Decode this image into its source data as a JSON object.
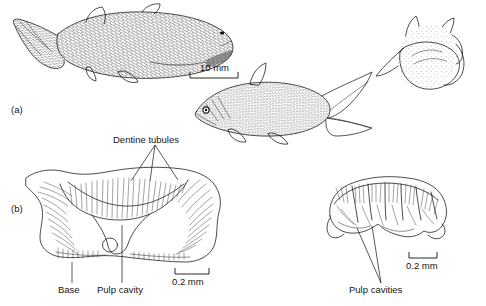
{
  "figure": {
    "kind": "scientific-illustration",
    "background_color": "#ffffff",
    "ink_color": "#111111",
    "panels": [
      {
        "id": "a",
        "label": "(a)",
        "caption_text": "(a)",
        "subjects": [
          {
            "name": "whole-fish-lateral",
            "description": "complete scaled fossil fish in lateral view, tail to left"
          },
          {
            "name": "fish-head-and-tail",
            "description": "second fossil fish, head with large eye facing left, forked caudal fin"
          },
          {
            "name": "fossil-specimen-3d",
            "description": "stippled three-dimensional fossil specimen block"
          }
        ],
        "scale_bars": [
          {
            "name": "scale-bar-10mm",
            "label": "10 mm"
          }
        ]
      },
      {
        "id": "b",
        "label": "(b)",
        "caption_text": "(b)",
        "subjects": [
          {
            "name": "denticle-section-left",
            "description": "dermal denticle cross-section with radiating dentine tubules"
          },
          {
            "name": "denticle-section-right",
            "description": "second denticle cross-section with multiple pulp cavities"
          }
        ],
        "scale_bars": [
          {
            "name": "scale-bar-0.2mm-left",
            "label": "0.2 mm"
          },
          {
            "name": "scale-bar-0.2mm-right",
            "label": "0.2 mm"
          }
        ]
      }
    ],
    "annotations": [
      {
        "name": "dentine-tubules-label",
        "text": "Dentine tubules",
        "leader_count": 3
      },
      {
        "name": "base-label",
        "text": "Base",
        "leader_count": 1
      },
      {
        "name": "pulp-cavity-label",
        "text": "Pulp cavity",
        "leader_count": 1
      },
      {
        "name": "pulp-cavities-label",
        "text": "Pulp cavities",
        "leader_count": 2
      }
    ],
    "labels": {
      "panel_a": "(a)",
      "panel_b": "(b)",
      "scale_10mm": "10 mm",
      "scale_02mm_left": "0.2 mm",
      "scale_02mm_right": "0.2 mm",
      "dentine_tubules": "Dentine tubules",
      "base": "Base",
      "pulp_cavity": "Pulp cavity",
      "pulp_cavities": "Pulp cavities"
    }
  }
}
